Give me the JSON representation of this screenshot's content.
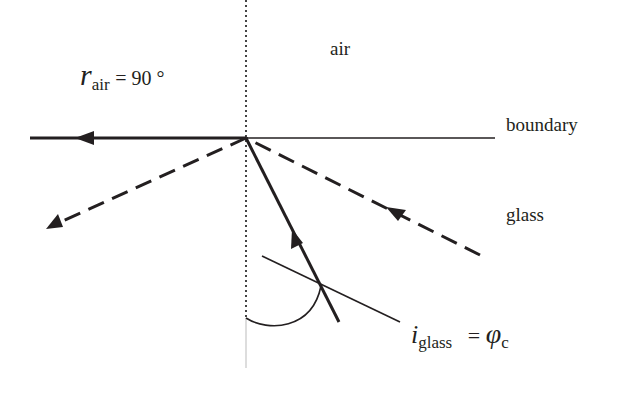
{
  "diagram": {
    "labels": {
      "r_air_symbol": "r",
      "r_air_subscript": "air",
      "r_air_value": "= 90 °",
      "air": "air",
      "boundary": "boundary",
      "glass": "glass",
      "i_glass_symbol": "i",
      "i_glass_subscript": "glass",
      "i_glass_equals": "=",
      "phi_symbol": "φ",
      "phi_subscript": "c"
    },
    "geometry": {
      "incidence_point": [
        246,
        138
      ],
      "normal": {
        "x": 246,
        "y_top": 0,
        "y_dotted_end": 318,
        "y_bottom": 368,
        "style": "dotted"
      },
      "boundary_line": {
        "x1": 30,
        "x2": 495,
        "y": 138
      },
      "rays": [
        {
          "name": "refracted-ray-along-boundary",
          "from": [
            246,
            138
          ],
          "to": [
            30,
            138
          ],
          "style": "solid",
          "arrow_at": [
            85,
            138
          ],
          "direction": "left"
        },
        {
          "name": "incident-ray-critical",
          "from": [
            339,
            322
          ],
          "to": [
            246,
            138
          ],
          "style": "solid",
          "arrow_at": [
            297,
            238
          ],
          "direction": "up"
        },
        {
          "name": "incident-ray-dashed",
          "from": [
            480,
            255
          ],
          "to": [
            246,
            138
          ],
          "style": "dashed",
          "arrow_at": [
            393,
            211
          ]
        },
        {
          "name": "reflected-ray-dashed",
          "from": [
            246,
            138
          ],
          "to": [
            48,
            228
          ],
          "style": "dashed",
          "arrow_at": [
            48,
            228
          ]
        }
      ],
      "label_leader": {
        "from": [
          262,
          256
        ],
        "to": [
          400,
          322
        ]
      },
      "angle_arc": {
        "from": [
          246,
          318
        ],
        "to": [
          321,
          286
        ]
      }
    },
    "colors": {
      "ink": "#231f20",
      "normal_bottom": "#bbbbbb",
      "background": "#ffffff"
    }
  }
}
